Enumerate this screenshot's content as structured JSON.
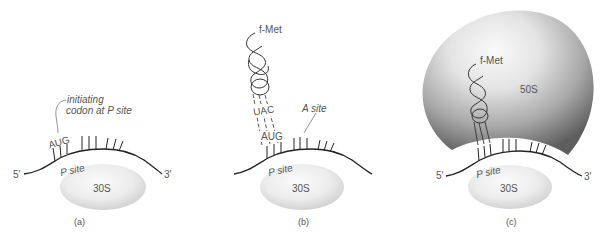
{
  "figure": {
    "panels": [
      {
        "id": "a",
        "caption": "(a)",
        "mrna": {
          "five_prime": "5'",
          "three_prime": "3'"
        },
        "subunit_small": "30S",
        "p_site": "P site",
        "codon": "AUG",
        "annotation_line1": "initiating",
        "annotation_line2": "codon at P site"
      },
      {
        "id": "b",
        "caption": "(b)",
        "amino_acid": "f-Met",
        "anticodon": "UAC",
        "codon": "AUG",
        "a_site": "A site",
        "p_site": "P site",
        "subunit_small": "30S"
      },
      {
        "id": "c",
        "caption": "(c)",
        "amino_acid": "f-Met",
        "subunit_large": "50S",
        "subunit_small": "30S",
        "p_site": "P site",
        "mrna": {
          "five_prime": "5'",
          "three_prime": "3'"
        }
      }
    ],
    "colors": {
      "line": "#222222",
      "text": "#555555",
      "ribosome_small_light": "#f7f7f7",
      "ribosome_small_dark": "#d4d4d4",
      "ribosome_large_light": "#f2f2f2",
      "ribosome_large_dark": "#6e6e6e"
    }
  }
}
